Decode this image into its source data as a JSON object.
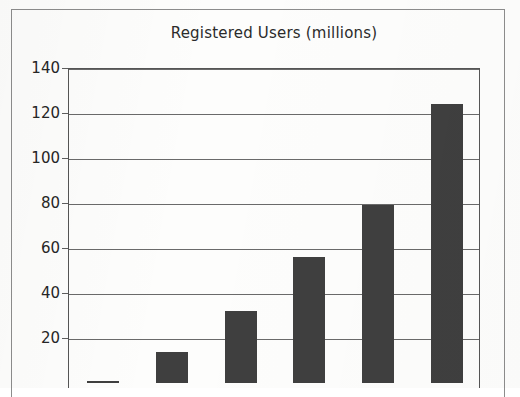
{
  "chart_data": {
    "type": "bar",
    "title": "Registered Users (millions)",
    "xlabel": "",
    "ylabel": "",
    "categories": [
      "",
      "",
      "",
      "",
      "",
      ""
    ],
    "values": [
      1,
      14,
      32,
      56,
      79,
      124
    ],
    "ylim": [
      0,
      140
    ],
    "y_ticks": [
      20,
      40,
      60,
      80,
      100,
      120,
      140
    ],
    "y_tick_labels": [
      "20",
      "40",
      "60",
      "80",
      "100",
      "120",
      "140"
    ],
    "grid": true,
    "legend": false,
    "legend_position": "none",
    "bar_color": "#3f3f3f"
  },
  "page": {
    "title": "Registered Users (millions)"
  }
}
